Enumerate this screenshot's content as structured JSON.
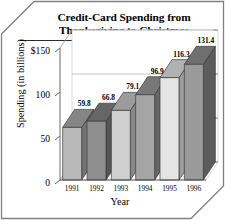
{
  "figure": {
    "frame_style": "chamfered-box",
    "background_color": "#ffffff",
    "border_color": "#7a7a7a"
  },
  "title": {
    "line1": "Credit-Card Spending from",
    "line2": "Thanksgiving to Christmas"
  },
  "chart_data": {
    "type": "bar",
    "title": "Credit-Card Spending from Thanksgiving to Christmas",
    "xlabel": "Year",
    "ylabel": "Spending (in billions)",
    "categories": [
      "1991",
      "1992",
      "1993",
      "1994",
      "1995",
      "1996"
    ],
    "values": [
      59.8,
      66.8,
      79.1,
      96.9,
      116.3,
      131.4
    ],
    "data_labels": [
      "59.8",
      "66.8",
      "79.1",
      "96.9",
      "116.3",
      "131.4"
    ],
    "ytick_labels": [
      "0",
      "50",
      "100",
      "$150"
    ],
    "ytick_values": [
      0,
      50,
      100,
      150
    ],
    "ylim": [
      0,
      150
    ],
    "grid": true,
    "legend": false,
    "three_d": true,
    "bar_colors": [
      "#b9b9b9",
      "#8f8f8f",
      "#cfcfcf",
      "#a5a5a5",
      "#e4e4e4",
      "#9a9a9a"
    ],
    "bar_top_colors": [
      "#868686",
      "#666666",
      "#9c9c9c",
      "#787878",
      "#b2b2b2",
      "#6f6f6f"
    ],
    "bar_side_colors": [
      "#737373",
      "#555555",
      "#888888",
      "#666666",
      "#9e9e9e",
      "#5c5c5c"
    ]
  }
}
